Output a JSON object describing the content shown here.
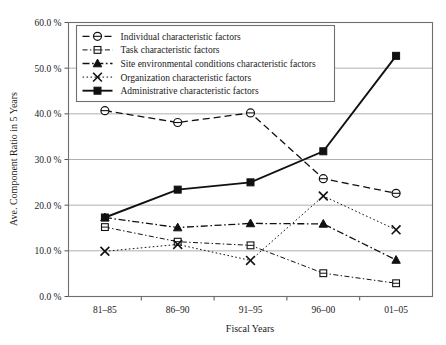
{
  "chart_data": {
    "type": "line",
    "title": "",
    "xlabel": "Fiscal Years",
    "ylabel": "Ave. Component Ratio in 5 Years",
    "categories": [
      "81–85",
      "86–90",
      "91–95",
      "96–00",
      "01–05"
    ],
    "ylim": [
      0,
      60
    ],
    "ytick_values": [
      0,
      10,
      20,
      30,
      40,
      50,
      60
    ],
    "ytick_labels": [
      "0.0 %",
      "10.0 %",
      "20.0 %",
      "30.0 %",
      "40.0 %",
      "50.0 %",
      "60.0 %"
    ],
    "grid": true,
    "legend_position": "upper-left-inside",
    "series": [
      {
        "name": "Individual characteristic factors",
        "values": [
          40.7,
          38.1,
          40.2,
          25.8,
          22.6
        ],
        "marker": "circle-open",
        "dash": "dashed",
        "color": "#111111"
      },
      {
        "name": "Task characteristic factors",
        "values": [
          15.2,
          12.0,
          11.2,
          5.1,
          2.9
        ],
        "marker": "square-open",
        "dash": "dash-dot-fine",
        "color": "#111111"
      },
      {
        "name": "Site environmental conditions characteristic factors",
        "values": [
          17.3,
          15.1,
          16.0,
          15.9,
          8.0
        ],
        "marker": "triangle-filled",
        "dash": "dash-dot",
        "color": "#111111"
      },
      {
        "name": "Organization characteristic factors",
        "values": [
          9.9,
          11.4,
          7.9,
          22.0,
          14.6
        ],
        "marker": "x-cross",
        "dash": "dotted",
        "color": "#111111"
      },
      {
        "name": "Administrative characteristic factors",
        "values": [
          17.3,
          23.4,
          25.0,
          31.8,
          52.7
        ],
        "marker": "square-filled",
        "dash": "solid",
        "color": "#111111"
      }
    ]
  }
}
